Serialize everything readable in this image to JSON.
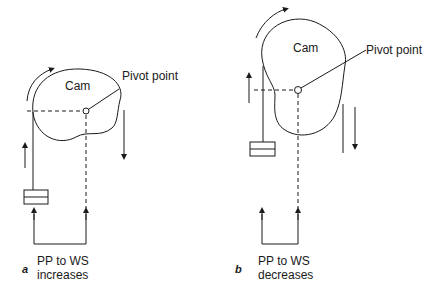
{
  "figure": {
    "panels": [
      {
        "id": "a",
        "panel_label": "a",
        "cam_label": "Cam",
        "pivot_label": "Pivot point",
        "caption_line1": "PP to WS",
        "caption_line2": "increases"
      },
      {
        "id": "b",
        "panel_label": "b",
        "cam_label": "Cam",
        "pivot_label": "Pivot point",
        "caption_line1": "PP to WS",
        "caption_line2": "decreases"
      }
    ],
    "colors": {
      "stroke": "#1a1a1a",
      "background": "#ffffff"
    }
  }
}
